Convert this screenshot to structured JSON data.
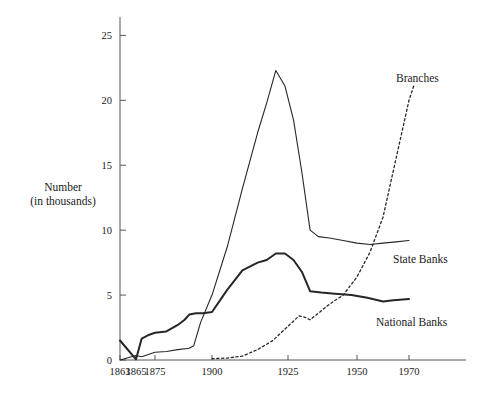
{
  "chart_data": {
    "type": "line",
    "title": "",
    "xlabel": "",
    "ylabel": "Number (in thousands)",
    "ylabel_line1": "Number",
    "ylabel_line2": "(in thousands)",
    "grid": false,
    "legend_position": "inline-right",
    "xlim": [
      1863,
      1972
    ],
    "ylim": [
      0,
      25.8
    ],
    "yticks": [
      0,
      5,
      10,
      15,
      20,
      25
    ],
    "ytick_labels": [
      "0",
      "5",
      "10",
      "15",
      "20",
      "25"
    ],
    "xticks": [
      1863,
      1865,
      1875,
      1900,
      1925,
      1950,
      1970
    ],
    "xtick_labels": [
      "1863",
      "1865",
      "1875",
      "1900",
      "1925",
      "1950",
      "1970"
    ],
    "series": [
      {
        "name": "State Banks",
        "style": "solid-thin",
        "label": "State Banks",
        "points": [
          [
            1863,
            0.0
          ],
          [
            1865,
            0.35
          ],
          [
            1868,
            0.25
          ],
          [
            1875,
            0.6
          ],
          [
            1880,
            0.65
          ],
          [
            1885,
            0.8
          ],
          [
            1890,
            0.9
          ],
          [
            1892,
            1.1
          ],
          [
            1895,
            2.9
          ],
          [
            1900,
            5.0
          ],
          [
            1905,
            8.7
          ],
          [
            1910,
            13.2
          ],
          [
            1915,
            17.5
          ],
          [
            1918,
            19.8
          ],
          [
            1921,
            22.3
          ],
          [
            1924,
            21.1
          ],
          [
            1927,
            18.5
          ],
          [
            1930,
            14.5
          ],
          [
            1933,
            10.0
          ],
          [
            1936,
            9.5
          ],
          [
            1940,
            9.4
          ],
          [
            1945,
            9.2
          ],
          [
            1950,
            9.0
          ],
          [
            1955,
            8.9
          ],
          [
            1960,
            9.0
          ],
          [
            1965,
            9.1
          ],
          [
            1970,
            9.2
          ]
        ]
      },
      {
        "name": "National Banks",
        "style": "solid-thick",
        "label": "National Banks",
        "points": [
          [
            1863,
            1.5
          ],
          [
            1865,
            0.05
          ],
          [
            1868,
            1.65
          ],
          [
            1872,
            1.95
          ],
          [
            1875,
            2.1
          ],
          [
            1880,
            2.2
          ],
          [
            1885,
            2.7
          ],
          [
            1888,
            3.1
          ],
          [
            1890,
            3.5
          ],
          [
            1893,
            3.6
          ],
          [
            1896,
            3.6
          ],
          [
            1900,
            3.7
          ],
          [
            1905,
            5.4
          ],
          [
            1910,
            6.9
          ],
          [
            1915,
            7.5
          ],
          [
            1918,
            7.7
          ],
          [
            1921,
            8.2
          ],
          [
            1924,
            8.2
          ],
          [
            1927,
            7.7
          ],
          [
            1930,
            6.8
          ],
          [
            1933,
            5.3
          ],
          [
            1937,
            5.2
          ],
          [
            1942,
            5.1
          ],
          [
            1948,
            5.0
          ],
          [
            1954,
            4.8
          ],
          [
            1960,
            4.5
          ],
          [
            1964,
            4.6
          ],
          [
            1970,
            4.7
          ]
        ]
      },
      {
        "name": "Branches",
        "style": "dotted",
        "label": "Branches",
        "points": [
          [
            1900,
            0.1
          ],
          [
            1905,
            0.15
          ],
          [
            1910,
            0.3
          ],
          [
            1915,
            0.8
          ],
          [
            1920,
            1.5
          ],
          [
            1925,
            2.6
          ],
          [
            1929,
            3.4
          ],
          [
            1931,
            3.3
          ],
          [
            1933,
            3.1
          ],
          [
            1936,
            3.6
          ],
          [
            1940,
            4.3
          ],
          [
            1945,
            5.0
          ],
          [
            1950,
            6.4
          ],
          [
            1955,
            8.3
          ],
          [
            1960,
            11.0
          ],
          [
            1965,
            15.5
          ],
          [
            1970,
            20.0
          ],
          [
            1972,
            21.2
          ]
        ]
      }
    ]
  },
  "labels": {
    "branches": "Branches",
    "state_banks": "State Banks",
    "national_banks": "National Banks"
  },
  "colors": {
    "line": "#262626",
    "axis": "#555555",
    "background": "#ffffff"
  }
}
